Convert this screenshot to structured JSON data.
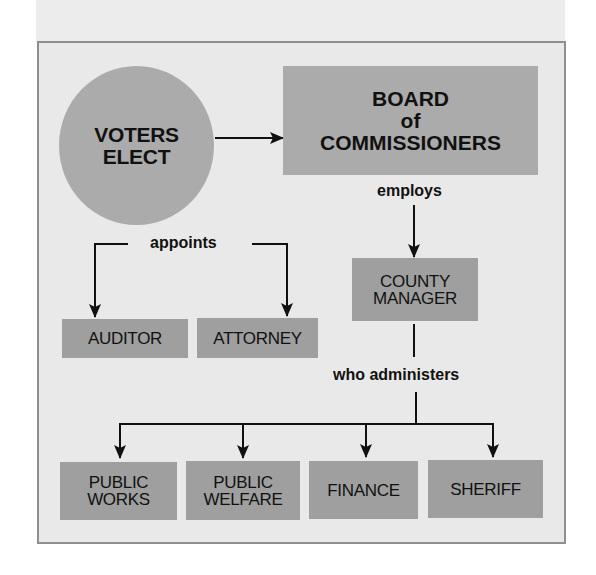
{
  "diagram": {
    "type": "org-chart",
    "title": "",
    "nodes": {
      "voters": {
        "line1": "VOTERS",
        "line2": "ELECT",
        "shape": "circle"
      },
      "board": {
        "line1": "BOARD",
        "line2": "of",
        "line3": "COMMISSIONERS",
        "shape": "rectangle"
      },
      "auditor": {
        "label": "AUDITOR"
      },
      "attorney": {
        "label": "ATTORNEY"
      },
      "county_manager": {
        "line1": "COUNTY",
        "line2": "MANAGER"
      },
      "public_works": {
        "line1": "PUBLIC",
        "line2": "WORKS"
      },
      "public_welfare": {
        "line1": "PUBLIC",
        "line2": "WELFARE"
      },
      "finance": {
        "label": "FINANCE"
      },
      "sheriff": {
        "label": "SHERIFF"
      }
    },
    "edge_labels": {
      "employs": "employs",
      "appoints": "appoints",
      "administers": "who administers"
    },
    "edges": [
      {
        "from": "voters",
        "to": "board",
        "label": ""
      },
      {
        "from": "board",
        "to": "auditor",
        "label": "appoints"
      },
      {
        "from": "board",
        "to": "attorney",
        "label": "appoints"
      },
      {
        "from": "board",
        "to": "county_manager",
        "label": "employs"
      },
      {
        "from": "county_manager",
        "to": "public_works",
        "label": "who administers"
      },
      {
        "from": "county_manager",
        "to": "public_welfare",
        "label": "who administers"
      },
      {
        "from": "county_manager",
        "to": "finance",
        "label": "who administers"
      },
      {
        "from": "county_manager",
        "to": "sheriff",
        "label": "who administers"
      }
    ],
    "colors": {
      "frame_bg": "#e9e9e9",
      "frame_border": "#8f8f8f",
      "primary_fill": "#ababab",
      "secondary_fill": "#9f9f9f",
      "line": "#111111"
    }
  }
}
